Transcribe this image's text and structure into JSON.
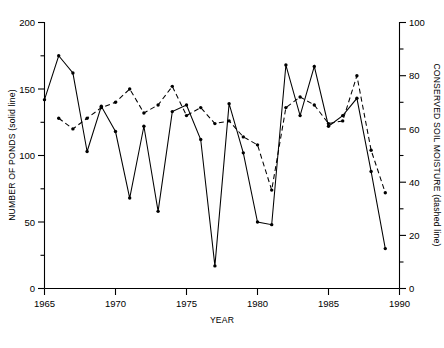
{
  "chart_data": {
    "type": "line",
    "title": "",
    "subtitle": "",
    "xlabel": "YEAR",
    "ylabel": "NUMBER OF PONDS (solid line)",
    "y2label": "CONSERVED SOIL MOISTURE (dashed line)",
    "grid": false,
    "legend": "none (encoded in axis titles: solid line = left axis, dashed line = right axis)",
    "xlim": [
      1965,
      1990
    ],
    "xticks": [
      1965,
      1970,
      1975,
      1980,
      1985,
      1990
    ],
    "xticklabels": [
      "1965",
      "1970",
      "1975",
      "1980",
      "1985",
      "1990"
    ],
    "ylim": [
      0,
      200
    ],
    "yticks": [
      0,
      50,
      100,
      150,
      200
    ],
    "yticklabels": [
      "0",
      "50",
      "100",
      "150",
      "200"
    ],
    "y2lim": [
      0,
      100
    ],
    "y2ticks": [
      0,
      20,
      40,
      60,
      80,
      100
    ],
    "y2ticklabels": [
      "0",
      "20",
      "40",
      "60",
      "80",
      "100"
    ],
    "series": [
      {
        "name": "NUMBER OF PONDS",
        "style": "solid line with filled circle markers",
        "axis": "left",
        "x": [
          1965,
          1966,
          1967,
          1968,
          1969,
          1970,
          1971,
          1972,
          1973,
          1974,
          1975,
          1976,
          1977,
          1978,
          1979,
          1980,
          1981,
          1982,
          1983,
          1984,
          1985,
          1986,
          1987,
          1988,
          1989
        ],
        "values": [
          142,
          175,
          162,
          103,
          137,
          118,
          68,
          122,
          58,
          133,
          138,
          112,
          17,
          139,
          102,
          50,
          48,
          168,
          130,
          167,
          122,
          130,
          143,
          88,
          30
        ]
      },
      {
        "name": "CONSERVED SOIL MOISTURE",
        "style": "dashed line with filled circle markers",
        "axis": "right",
        "x": [
          1966,
          1967,
          1968,
          1969,
          1970,
          1971,
          1972,
          1973,
          1974,
          1975,
          1976,
          1977,
          1978,
          1979,
          1980,
          1981,
          1982,
          1983,
          1984,
          1985,
          1986,
          1987,
          1988,
          1989
        ],
        "values": [
          64,
          60,
          64,
          68,
          70,
          75,
          66,
          69,
          76,
          65,
          68,
          62,
          63,
          57,
          54,
          37,
          68,
          72,
          69,
          62,
          63,
          80,
          52,
          36
        ]
      }
    ]
  },
  "axes": {
    "x_title": "YEAR",
    "y_left_title": "NUMBER OF PONDS (solid line)",
    "y_right_title": "CONSERVED SOIL MOISTURE (dashed line)"
  },
  "ticks": {
    "x": [
      "1965",
      "1970",
      "1975",
      "1980",
      "1985",
      "1990"
    ],
    "y_left": [
      "200",
      "150",
      "100",
      "50",
      "0"
    ],
    "y_right": [
      "100",
      "80",
      "60",
      "40",
      "20",
      "0"
    ]
  },
  "colors": {
    "background": "#ffffff",
    "foreground": "#000000",
    "series_solid": "#000000",
    "series_dashed": "#000000"
  }
}
